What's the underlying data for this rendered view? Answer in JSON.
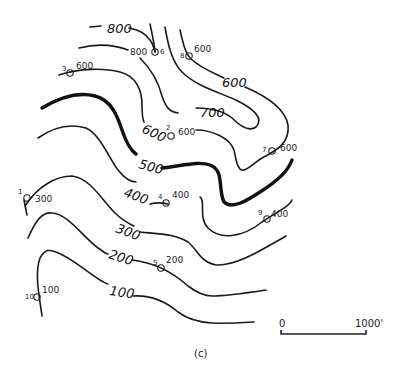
{
  "figure": {
    "caption": "(c)",
    "scale_bar": {
      "start_label": "0",
      "end_label": "1000'"
    }
  },
  "contours": [
    {
      "value": "800",
      "label": "800",
      "label2": "800"
    },
    {
      "value": "700",
      "label": "700"
    },
    {
      "value": "600",
      "label": "600",
      "label_b": "600"
    },
    {
      "value": "500",
      "label": "500",
      "index": true
    },
    {
      "value": "400",
      "label": "400"
    },
    {
      "value": "300",
      "label": "300"
    },
    {
      "value": "200",
      "label": "200"
    },
    {
      "value": "100",
      "label": "100"
    }
  ],
  "points": [
    {
      "id": "1",
      "value": "300"
    },
    {
      "id": "2",
      "value": "600"
    },
    {
      "id": "3",
      "value": "600"
    },
    {
      "id": "4",
      "value": "400"
    },
    {
      "id": "5",
      "value": "200"
    },
    {
      "id": "6",
      "value": ""
    },
    {
      "id": "7",
      "value": "600"
    },
    {
      "id": "8",
      "value": "600"
    },
    {
      "id": "9",
      "value": "400"
    },
    {
      "id": "10",
      "value": "100"
    }
  ]
}
